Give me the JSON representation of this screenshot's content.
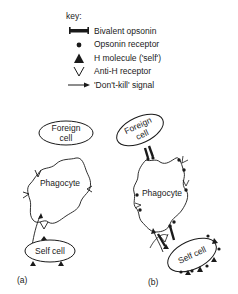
{
  "key": {
    "title": "key:",
    "items": [
      {
        "symbol": "bivalent-opsonin",
        "label": "Bivalent opsonin"
      },
      {
        "symbol": "opsonin-receptor",
        "label": "Opsonin receptor"
      },
      {
        "symbol": "h-molecule",
        "label": "H molecule ('self')"
      },
      {
        "symbol": "anti-h-receptor",
        "label": "Anti-H receptor"
      },
      {
        "symbol": "dont-kill-signal",
        "label": "'Don't-kill' signal"
      }
    ]
  },
  "panel_a": {
    "label": "(a)",
    "foreign_cell": "Foreign cell",
    "foreign_cell_line1": "Foreign",
    "foreign_cell_line2": "cell",
    "phagocyte": "Phagocyte",
    "self_cell": "Self cell"
  },
  "panel_b": {
    "label": "(b)",
    "foreign_cell_line1": "Foreign",
    "foreign_cell_line2": "cell",
    "phagocyte": "Phagocyte",
    "self_cell": "Self cell"
  },
  "colors": {
    "ink": "#1a1a1a",
    "background": "#ffffff"
  }
}
